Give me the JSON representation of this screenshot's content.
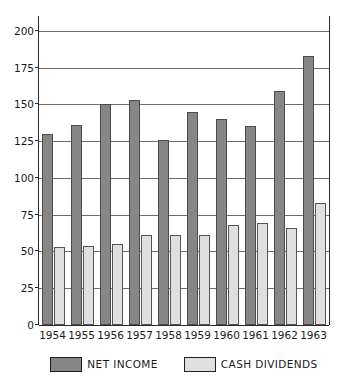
{
  "chart_data": {
    "type": "bar",
    "title": "",
    "subtitle": "",
    "xlabel": "",
    "ylabel": "",
    "categories": [
      "1954",
      "1955",
      "1956",
      "1957",
      "1958",
      "1959",
      "1960",
      "1961",
      "1962",
      "1963"
    ],
    "series": [
      {
        "name": "NET INCOME",
        "color": "#868686",
        "values": [
          130,
          136,
          150,
          153,
          126,
          145,
          140,
          135,
          159,
          183
        ]
      },
      {
        "name": "CASH DIVIDENDS",
        "color": "#dfdfdf",
        "values": [
          53,
          54,
          55,
          61,
          61,
          61,
          68,
          69,
          66,
          83
        ]
      }
    ],
    "ylim": [
      0,
      210
    ],
    "yticks": [
      0,
      25,
      50,
      75,
      100,
      125,
      150,
      175,
      200
    ],
    "ytick_labels": [
      "0",
      "25",
      "50",
      "75",
      "100",
      "125",
      "150",
      "175",
      "200"
    ],
    "grid": true,
    "grid_axis": "y",
    "legend_position": "bottom"
  },
  "legend": {
    "entries": [
      {
        "label": "NET INCOME",
        "swatch": "net"
      },
      {
        "label": "CASH DIVIDENDS",
        "swatch": "div"
      }
    ]
  },
  "axes": {
    "frame_color": "#2b2b2b",
    "grid_color": "#6d6d6d"
  }
}
